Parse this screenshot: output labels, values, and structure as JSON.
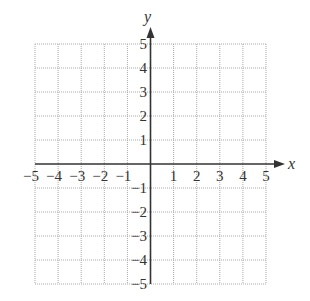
{
  "chart_data": {
    "type": "scatter",
    "title": "",
    "xlabel": "x",
    "ylabel": "y",
    "xlim": [
      -5,
      5
    ],
    "ylim": [
      -5,
      5
    ],
    "grid": true,
    "grid_style": "dotted",
    "x_ticks": [
      -5,
      -4,
      -3,
      -2,
      -1,
      1,
      2,
      3,
      4,
      5
    ],
    "y_ticks": [
      5,
      4,
      3,
      2,
      1,
      -1,
      -2,
      -3,
      -4,
      -5
    ],
    "x_tick_labels": [
      "−5",
      "−4",
      "−3",
      "−2",
      "−1",
      "1",
      "2",
      "3",
      "4",
      "5"
    ],
    "y_tick_labels": [
      "5",
      "4",
      "3",
      "2",
      "1",
      "−1",
      "−2",
      "−3",
      "−4",
      "−5"
    ],
    "series": [],
    "legend": null
  },
  "axes": {
    "x_label": "x",
    "y_label": "y"
  },
  "colors": {
    "axis": "#333333",
    "grid": "#aaaaaa",
    "text": "#333333"
  }
}
